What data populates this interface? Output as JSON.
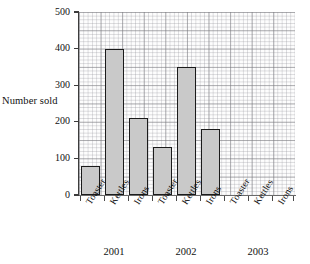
{
  "chart_data": {
    "type": "bar",
    "title": "",
    "xlabel": "",
    "ylabel": "Number sold",
    "ylim": [
      0,
      500
    ],
    "ytick_labels": [
      "0",
      "100",
      "200",
      "300",
      "400",
      "500"
    ],
    "ytick_values": [
      0,
      100,
      200,
      300,
      400,
      500
    ],
    "grid": true,
    "grid_style": "graph-paper",
    "legend": "none",
    "categories": [
      "Toaster",
      "Kettles",
      "Irons"
    ],
    "groups": [
      "2001",
      "2002",
      "2003"
    ],
    "series": [
      {
        "name": "2001",
        "categories": [
          "Toaster",
          "Kettles",
          "Irons"
        ],
        "values": [
          80,
          400,
          210
        ]
      },
      {
        "name": "2002",
        "categories": [
          "Toaster",
          "Kettles",
          "Irons"
        ],
        "values": [
          130,
          350,
          180
        ]
      },
      {
        "name": "2003",
        "categories": [
          "Toaster",
          "Kettles",
          "Irons"
        ],
        "values": [
          null,
          null,
          null
        ]
      }
    ],
    "bars": [
      {
        "group": "2001",
        "category": "Toaster",
        "value": 80
      },
      {
        "group": "2001",
        "category": "Kettles",
        "value": 400
      },
      {
        "group": "2001",
        "category": "Irons",
        "value": 210
      },
      {
        "group": "2002",
        "category": "Toaster",
        "value": 130
      },
      {
        "group": "2002",
        "category": "Kettles",
        "value": 350
      },
      {
        "group": "2002",
        "category": "Irons",
        "value": 180
      },
      {
        "group": "2003",
        "category": "Toaster",
        "value": null
      },
      {
        "group": "2003",
        "category": "Kettles",
        "value": null
      },
      {
        "group": "2003",
        "category": "Irons",
        "value": null
      }
    ],
    "colors": {
      "bar_fill": "#c9c9c9",
      "bar_outline": "#1b1b1b",
      "grid_major": "#787880",
      "grid_minor": "#96969e",
      "axis": "#3c3c3c",
      "text": "#111111",
      "background": "#ffffff"
    }
  },
  "axis": {
    "y_label": "Number sold",
    "ticks": [
      {
        "label": "500",
        "value": 500
      },
      {
        "label": "400",
        "value": 400
      },
      {
        "label": "300",
        "value": 300
      },
      {
        "label": "200",
        "value": 200
      },
      {
        "label": "100",
        "value": 100
      },
      {
        "label": "0",
        "value": 0
      }
    ]
  },
  "x_categories": [
    {
      "label": "Toaster",
      "group": "2001"
    },
    {
      "label": "Kettles",
      "group": "2001"
    },
    {
      "label": "Irons",
      "group": "2001"
    },
    {
      "label": "Toaster",
      "group": "2002"
    },
    {
      "label": "Kettles",
      "group": "2002"
    },
    {
      "label": "Irons",
      "group": "2002"
    },
    {
      "label": "Toaster",
      "group": "2003"
    },
    {
      "label": "Kettles",
      "group": "2003"
    },
    {
      "label": "Irons",
      "group": "2003"
    }
  ],
  "group_labels": [
    {
      "label": "2001"
    },
    {
      "label": "2002"
    },
    {
      "label": "2003"
    }
  ]
}
